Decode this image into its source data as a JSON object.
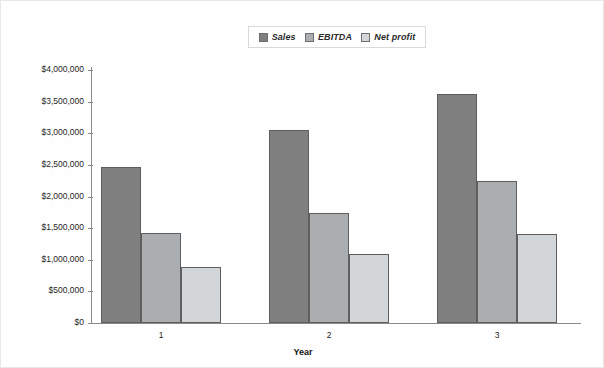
{
  "chart_data": {
    "type": "bar",
    "title": "",
    "subtitle": "",
    "xlabel": "Year",
    "ylabel": "",
    "categories": [
      "1",
      "2",
      "3"
    ],
    "series": [
      {
        "name": "Sales",
        "color": "#7f7f7f",
        "values": [
          2460000,
          3050000,
          3620000
        ]
      },
      {
        "name": "EBITDA",
        "color": "#aaaeb0",
        "values": [
          1430000,
          1740000,
          2240000
        ]
      },
      {
        "name": "Net profit",
        "color": "#d2d6d9",
        "values": [
          890000,
          1090000,
          1400000
        ]
      }
    ],
    "ylim": [
      0,
      4000000
    ],
    "ytick_values": [
      0,
      500000,
      1000000,
      1500000,
      2000000,
      2500000,
      3000000,
      3500000,
      4000000
    ],
    "ytick_labels": [
      "$0",
      "$500,000",
      "$1,000,000",
      "$1,500,000",
      "$2,000,000",
      "$2,500,000",
      "$3,000,000",
      "$3,500,000",
      "$4,000,000"
    ],
    "grid": false,
    "legend_position": "top-center",
    "bar_style": "grouped-contiguous"
  },
  "legend": {
    "entries": [
      {
        "label": "Sales"
      },
      {
        "label": "EBITDA"
      },
      {
        "label": "Net profit"
      }
    ]
  },
  "axes": {
    "x_title": "Year",
    "x_tick_labels": [
      "1",
      "2",
      "3"
    ],
    "y_tick_labels": [
      "$4,000,000",
      "$3,500,000",
      "$3,000,000",
      "$2,500,000",
      "$2,000,000",
      "$1,500,000",
      "$1,000,000",
      "$500,000",
      "$0"
    ]
  }
}
